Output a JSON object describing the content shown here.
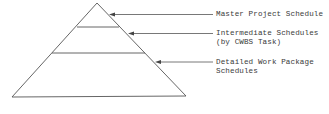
{
  "diagram": {
    "type": "schedule-hierarchy-pyramid",
    "line_color": "#555555",
    "levels": [
      {
        "name": "master",
        "label_lines": [
          "Master Project Schedule"
        ]
      },
      {
        "name": "intermediate",
        "label_lines": [
          "Intermediate Schedules",
          "(by CWBS Task)"
        ]
      },
      {
        "name": "detailed",
        "label_lines": [
          "Detailed Work Package",
          "Schedules"
        ]
      }
    ]
  }
}
